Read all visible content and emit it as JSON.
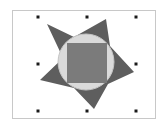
{
  "canvas": {
    "background": "#ffffff",
    "frame": {
      "x": 12,
      "y": 10,
      "width": 143,
      "height": 108,
      "stroke": "#c8c8c8"
    }
  },
  "group": {
    "star": {
      "fill": "#5e5e5e",
      "points": "47,24 74,37 106,19 110,46 134,72 108,84 94,109 74,88 40,80 63,58"
    },
    "circle": {
      "cx": 86,
      "cy": 62,
      "r": 28,
      "fill": "#dadada",
      "stroke": "#c4c4c4"
    },
    "square": {
      "x": 67,
      "y": 43,
      "width": 40,
      "height": 40,
      "fill": "#7b7b7b"
    }
  },
  "selection_handles": [
    {
      "name": "top-left",
      "x": 38,
      "y": 17
    },
    {
      "name": "top-center",
      "x": 87,
      "y": 17
    },
    {
      "name": "top-right",
      "x": 136,
      "y": 17
    },
    {
      "name": "middle-left",
      "x": 38,
      "y": 64
    },
    {
      "name": "middle-right",
      "x": 136,
      "y": 64
    },
    {
      "name": "bottom-left",
      "x": 38,
      "y": 111
    },
    {
      "name": "bottom-center",
      "x": 87,
      "y": 111
    },
    {
      "name": "bottom-right",
      "x": 136,
      "y": 111
    }
  ],
  "handle_color": "#1a1a1a"
}
